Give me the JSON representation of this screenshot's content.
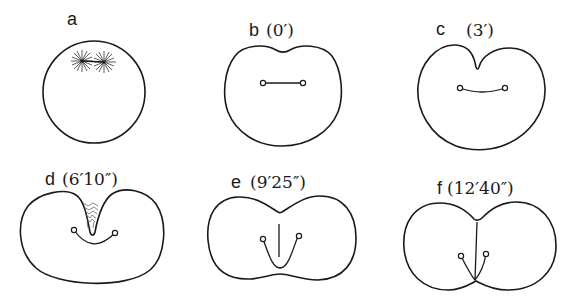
{
  "figure": {
    "panels": [
      {
        "id": "a",
        "letter": "a",
        "time": ""
      },
      {
        "id": "b",
        "letter": "b",
        "time": "(0′)"
      },
      {
        "id": "c",
        "letter": "c",
        "time": "(3′)"
      },
      {
        "id": "d",
        "letter": "d",
        "time": "(6′10″)"
      },
      {
        "id": "e",
        "letter": "e",
        "time": "(9′25″)"
      },
      {
        "id": "f",
        "letter": "f",
        "time": "(12′40″)"
      }
    ]
  },
  "colors": {
    "line": "#1a1a1a",
    "background": "#ffffff"
  }
}
